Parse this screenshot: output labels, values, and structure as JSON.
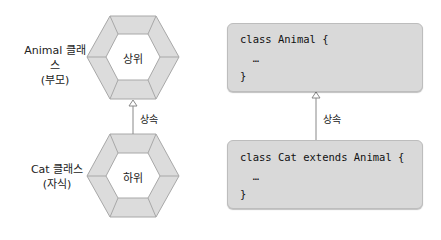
{
  "left_diagram": {
    "parent": {
      "class_label": "Animal 클래스",
      "role_label": "(부모)",
      "hex_text": "상위"
    },
    "child": {
      "class_label": "Cat 클래스",
      "role_label": "(자식)",
      "hex_text": "하위"
    },
    "relation_label": "상속"
  },
  "right_diagram": {
    "parent_code": {
      "line1": "class Animal {",
      "line2": "  …",
      "line3": "}"
    },
    "child_code": {
      "line1": "class Cat extends Animal {",
      "line2": "  …",
      "line3": "}"
    },
    "relation_label": "상속"
  },
  "colors": {
    "hex_fill": "#dcdcdc",
    "hex_stroke": "#a8a8a8",
    "box_fill": "#d9d9d9",
    "arrow": "#888888"
  }
}
